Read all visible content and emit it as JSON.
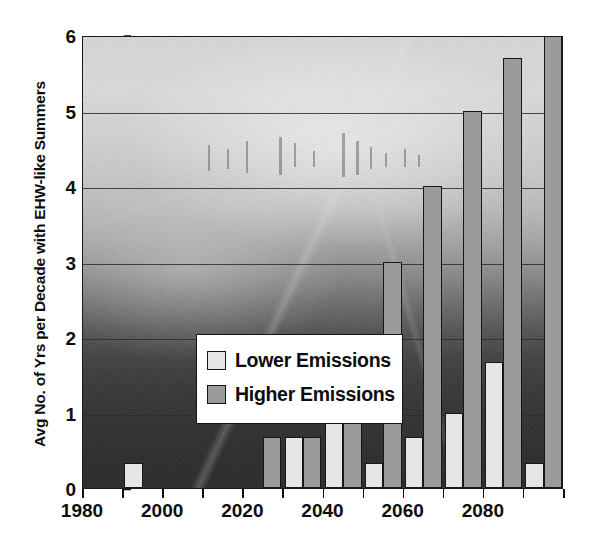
{
  "chart_data": {
    "type": "bar",
    "title": "",
    "xlabel": "",
    "ylabel": "Avg No. of Yrs per Decade with EHW-like Summers",
    "ylim": [
      0,
      6
    ],
    "yticks": [
      0,
      1,
      2,
      3,
      4,
      5,
      6
    ],
    "ytick_labels": [
      "0",
      "1",
      "2",
      "3",
      "4",
      "5",
      "6"
    ],
    "xlim": [
      1975,
      2095
    ],
    "xtick_labels": [
      "1980",
      "2000",
      "2020",
      "2040",
      "2060",
      "2080"
    ],
    "xtick_values": [
      1980,
      2000,
      2020,
      2040,
      2060,
      2080
    ],
    "minor_xticks": [
      1980,
      1990,
      2000,
      2010,
      2020,
      2030,
      2040,
      2050,
      2060,
      2070,
      2080,
      2090
    ],
    "grid": "horizontal",
    "legend_position": "center-left-inside",
    "categories": [
      "1980s",
      "1990s",
      "2000s",
      "2010s",
      "2020s",
      "2030s",
      "2040s",
      "2050s",
      "2060s",
      "2070s",
      "2080s",
      "2090s"
    ],
    "series": [
      {
        "name": "Lower Emissions",
        "color": "#e6e6e6",
        "values": [
          0,
          0.33,
          0,
          0,
          0,
          0.67,
          1.0,
          0.33,
          0.67,
          1.0,
          1.67,
          0.33
        ]
      },
      {
        "name": "Higher Emissions",
        "color": "#9b9b9b",
        "values": [
          0,
          0,
          0,
          0,
          0.67,
          0.67,
          1.0,
          3.0,
          4.0,
          5.0,
          5.7,
          6.0
        ]
      }
    ],
    "background": "grayscale aerial photograph of a smog-covered city"
  },
  "legend": {
    "items": [
      {
        "label": "Lower Emissions",
        "swatch": "lower"
      },
      {
        "label": "Higher Emissions",
        "swatch": "higher"
      }
    ]
  },
  "colors": {
    "lower_emissions": "#e6e6e6",
    "higher_emissions": "#9b9b9b",
    "axis": "#1a1a1a",
    "gridline": "#2b2b2b",
    "text": "#0d0d0d",
    "legend_background": "#ffffff"
  }
}
